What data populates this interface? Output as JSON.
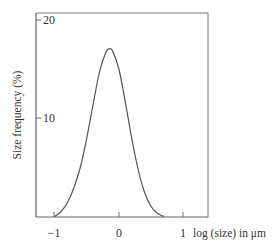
{
  "chart_data": {
    "type": "line",
    "title": "",
    "xlabel": "log (size) in μm",
    "ylabel": "Size frequency (%)",
    "xlim": [
      -1.3,
      1.4
    ],
    "ylim": [
      0,
      21
    ],
    "x_ticks": [
      -1,
      0,
      1
    ],
    "x_tick_labels": [
      "−1",
      "0",
      "1"
    ],
    "y_ticks": [
      10,
      20
    ],
    "y_tick_labels": [
      "10",
      "20"
    ],
    "grid": false,
    "legend": null,
    "series": [
      {
        "name": "size distribution",
        "x": [
          -1.0,
          -0.9,
          -0.8,
          -0.7,
          -0.6,
          -0.5,
          -0.4,
          -0.3,
          -0.2,
          -0.15,
          -0.1,
          0.0,
          0.1,
          0.2,
          0.3,
          0.4,
          0.5,
          0.6,
          0.7
        ],
        "values": [
          0.0,
          0.5,
          1.4,
          2.9,
          5.0,
          8.0,
          11.5,
          14.8,
          16.8,
          17.1,
          16.9,
          15.0,
          11.6,
          7.9,
          4.7,
          2.4,
          1.0,
          0.3,
          0.0
        ]
      }
    ]
  },
  "labels": {
    "ylabel": "Size frequency (%)",
    "xlabel": "log (size) in μm",
    "y20": "20",
    "y10": "10",
    "xm1": "−1",
    "x0": "0",
    "x1": "1"
  },
  "colors": {
    "line": "#555555",
    "frame": "#777777",
    "text": "#333333"
  }
}
